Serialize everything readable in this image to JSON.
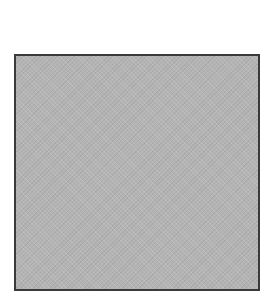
{
  "swatch": {
    "fill_color": "#b4b4b4",
    "border_color": "#3a3a3a"
  }
}
